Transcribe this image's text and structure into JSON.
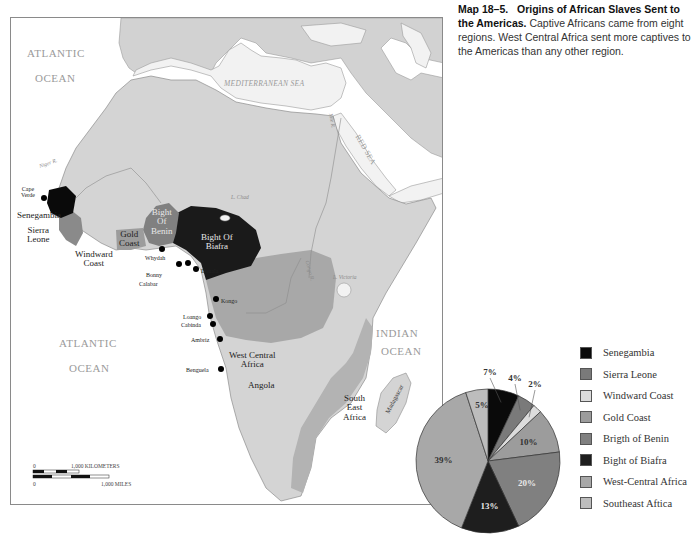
{
  "caption": {
    "figure_number": "Map 18–5.",
    "title": "Origins of African Slaves Sent to the Americas.",
    "body": "Captive Africans came from eight regions. West Central Africa sent more captives to the Americas than any other region."
  },
  "map": {
    "oceans": {
      "atlantic_north_1": "ATLANTIC",
      "atlantic_north_2": "OCEAN",
      "atlantic_south_1": "ATLANTIC",
      "atlantic_south_2": "OCEAN",
      "indian_1": "INDIAN",
      "indian_2": "OCEAN",
      "mediterranean": "MEDITERRANEAN SEA",
      "red_sea": "RED SEA"
    },
    "features": {
      "niger": "Niger R.",
      "chad": "L. Chad",
      "nile": "Nile R.",
      "congo": "Congo R.",
      "victoria": "L. Victoria",
      "madagascar": "Madagascar"
    },
    "regions": {
      "senegambia": "Senegambia",
      "sierra_leone_1": "Sierra",
      "sierra_leone_2": "Leone",
      "windward_1": "Windward",
      "windward_2": "Coast",
      "gold_1": "Gold",
      "gold_2": "Coast",
      "benin_1": "Bight",
      "benin_2": "Of",
      "benin_3": "Benin",
      "biafra_1": "Bight Of",
      "biafra_2": "Biafra",
      "wca_1": "West Central",
      "wca_2": "Africa",
      "angola": "Angola",
      "sea_1": "South",
      "sea_2": "East",
      "sea_3": "Africa"
    },
    "ports": {
      "cape_verde_1": "Cape",
      "cape_verde_2": "Verde",
      "whydah": "Whydah",
      "bonny": "Bonny",
      "calabar": "Calabar",
      "douala": "Douala",
      "kongo": "Kongo",
      "loango": "Loango",
      "cabinda": "Cabinda",
      "ambriz": "Ambriz",
      "benguela": "Benguela"
    },
    "scale": {
      "km_zero": "0",
      "km_label": "1,000 KILOMETERS",
      "mi_zero": "0",
      "mi_label": "1,000 MILES"
    }
  },
  "legend": {
    "items": [
      {
        "label": "Senegambia",
        "color": "#0a0a0a"
      },
      {
        "label": "Sierra Leone",
        "color": "#7a7a7a"
      },
      {
        "label": "Windward Coast",
        "color": "#dcdcdc"
      },
      {
        "label": "Gold Coast",
        "color": "#9c9c9c"
      },
      {
        "label": "Brigth of Benin",
        "color": "#808080"
      },
      {
        "label": "Bight of Biafra",
        "color": "#1e1e1e"
      },
      {
        "label": "West-Central Africa",
        "color": "#a8a8a8"
      },
      {
        "label": "Southeast Aftica",
        "color": "#bdbdbd"
      }
    ]
  },
  "chart_data": {
    "type": "pie",
    "title": "Origins of African Slaves Sent to the Americas",
    "categories": [
      "Senegambia",
      "Sierra Leone",
      "Windward Coast",
      "Gold Coast",
      "Bight of Benin",
      "Bight of Biafra",
      "West-Central Africa",
      "Southeast Africa"
    ],
    "values": [
      7,
      4,
      2,
      10,
      20,
      13,
      39,
      5
    ],
    "labels": [
      "7%",
      "4%",
      "2%",
      "10%",
      "20%",
      "13%",
      "39%",
      "5%"
    ],
    "colors": [
      "#0a0a0a",
      "#7a7a7a",
      "#dcdcdc",
      "#9c9c9c",
      "#808080",
      "#1e1e1e",
      "#a8a8a8",
      "#bdbdbd"
    ],
    "legend_position": "right"
  }
}
